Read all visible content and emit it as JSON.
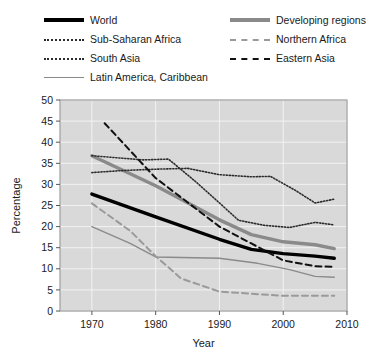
{
  "chart_data": {
    "type": "line",
    "title": "",
    "xlabel": "Year",
    "ylabel": "Percentage",
    "xlim": [
      1965,
      2010
    ],
    "ylim": [
      0,
      50
    ],
    "xticks": [
      1970,
      1980,
      1990,
      2000,
      2010
    ],
    "yticks": [
      0,
      5,
      10,
      15,
      20,
      25,
      30,
      35,
      40,
      45,
      50
    ],
    "grid": true,
    "legend_position": "above-plot",
    "plot_background": "#d9d9d9",
    "series": [
      {
        "name": "World",
        "style": "solid-thick",
        "color": "#000000",
        "x": [
          1970,
          1980,
          1990,
          1995,
          2000,
          2005,
          2008
        ],
        "values": [
          27.7,
          22.3,
          17.0,
          14.6,
          13.6,
          13.0,
          12.5
        ]
      },
      {
        "name": "Developing regions",
        "style": "solid-thick",
        "color": "#8a8a8a",
        "x": [
          1970,
          1980,
          1990,
          1995,
          2000,
          2005,
          2008
        ],
        "values": [
          36.8,
          29.7,
          21.6,
          18.1,
          16.4,
          15.7,
          14.8
        ]
      },
      {
        "name": "Sub-Saharan Africa",
        "style": "dotted",
        "color": "#2b2b2b",
        "x": [
          1970,
          1975,
          1980,
          1985,
          1990,
          1995,
          1998,
          2002,
          2005,
          2008
        ],
        "values": [
          32.8,
          33.3,
          33.6,
          33.8,
          32.3,
          31.8,
          31.9,
          28.5,
          25.6,
          26.5
        ]
      },
      {
        "name": "South Asia",
        "style": "dotted",
        "color": "#2b2b2b",
        "x": [
          1970,
          1978,
          1982,
          1986,
          1990,
          1993,
          1997,
          2001,
          2005,
          2008
        ],
        "values": [
          36.8,
          35.8,
          36.0,
          31.0,
          25.6,
          21.5,
          20.3,
          19.8,
          21.0,
          20.4
        ]
      },
      {
        "name": "Latin America, Caribbean",
        "style": "solid-thin",
        "color": "#8a8a8a",
        "x": [
          1970,
          1976,
          1980,
          1990,
          1996,
          2001,
          2005,
          2008
        ],
        "values": [
          20.0,
          16.0,
          12.8,
          12.5,
          11.3,
          9.8,
          8.2,
          8.0
        ]
      },
      {
        "name": "Northern Africa",
        "style": "dashed",
        "color": "#9a9a9a",
        "x": [
          1970,
          1976,
          1980,
          1984,
          1990,
          2000,
          2008
        ],
        "values": [
          25.5,
          19.0,
          13.0,
          7.7,
          4.6,
          3.6,
          3.6
        ]
      },
      {
        "name": "Eastern Asia",
        "style": "dashed",
        "color": "#111111",
        "x": [
          1972,
          1980,
          1990,
          1995,
          2000,
          2005,
          2008
        ],
        "values": [
          44.5,
          31.5,
          20.0,
          16.0,
          12.0,
          10.6,
          10.5
        ]
      }
    ]
  },
  "legend": {
    "items": [
      {
        "label": "World",
        "swatch": "sw-world",
        "col": 0,
        "row": 0
      },
      {
        "label": "Sub-Saharan Africa",
        "swatch": "sw-ssa",
        "col": 0,
        "row": 1
      },
      {
        "label": "South Asia",
        "swatch": "sw-sa",
        "col": 0,
        "row": 2
      },
      {
        "label": "Latin America, Caribbean",
        "swatch": "sw-lac",
        "col": 0,
        "row": 3
      },
      {
        "label": "Developing regions",
        "swatch": "sw-dev",
        "col": 1,
        "row": 0
      },
      {
        "label": "Northern Africa",
        "swatch": "sw-na",
        "col": 1,
        "row": 1
      },
      {
        "label": "Eastern Asia",
        "swatch": "sw-ea",
        "col": 1,
        "row": 2
      }
    ]
  }
}
